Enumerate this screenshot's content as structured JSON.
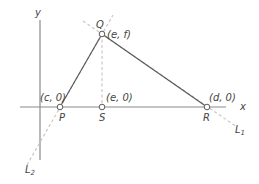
{
  "diagram": {
    "axes": {
      "x_label": "x",
      "y_label": "y"
    },
    "points": {
      "P": {
        "name": "P",
        "coord_label": "(c, 0)"
      },
      "Q": {
        "name": "Q",
        "coord_label": "(e, f)"
      },
      "R": {
        "name": "R",
        "coord_label": "(d, 0)"
      },
      "S": {
        "name": "S",
        "coord_label": "(e, 0)"
      }
    },
    "lines": {
      "L1": {
        "letter": "L",
        "subscript": "1"
      },
      "L2": {
        "letter": "L",
        "subscript": "2"
      }
    },
    "colors": {
      "axis": "#8a8a8a",
      "segment": "#5a5a5a",
      "dashed": "#c8c8c8",
      "text": "#444444"
    }
  }
}
